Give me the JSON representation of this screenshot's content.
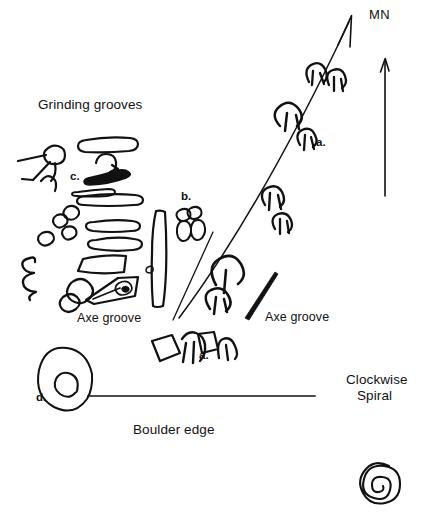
{
  "figure": {
    "kind": "archaeological-site-plan"
  },
  "labels": {
    "grinding_grooves": "Grinding grooves",
    "axe_groove_left": "Axe groove",
    "axe_groove_right": "Axe groove",
    "boulder_edge": "Boulder edge",
    "clockwise_spiral_line1": "Clockwise",
    "clockwise_spiral_line2": "Spiral",
    "magnetic_north": "MN"
  },
  "keys": {
    "a_upper": "a.",
    "a_lower": "a.",
    "b": "b.",
    "c": "c.",
    "d": "d."
  },
  "colors": {
    "ink": "#111111",
    "background": "#ffffff"
  }
}
